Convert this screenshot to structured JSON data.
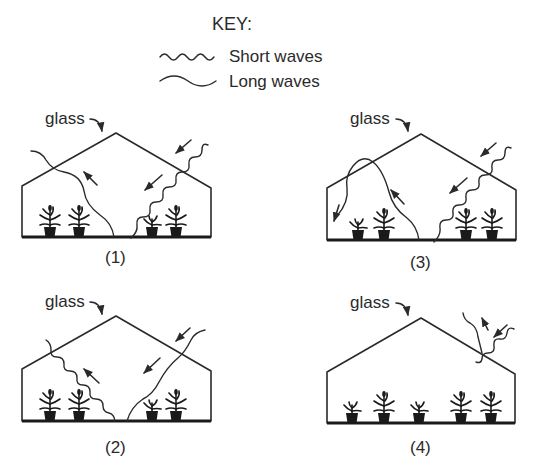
{
  "key": {
    "title": "KEY:",
    "items": [
      {
        "icon": "short-wave-icon",
        "label": "Short waves"
      },
      {
        "icon": "long-wave-icon",
        "label": "Long waves"
      }
    ]
  },
  "panels": [
    {
      "number": "(1)",
      "glass_label": "glass"
    },
    {
      "number": "(2)",
      "glass_label": "glass"
    },
    {
      "number": "(3)",
      "glass_label": "glass"
    },
    {
      "number": "(4)",
      "glass_label": "glass"
    }
  ],
  "colors": {
    "ink": "#2a2a2a",
    "background": "#ffffff"
  }
}
